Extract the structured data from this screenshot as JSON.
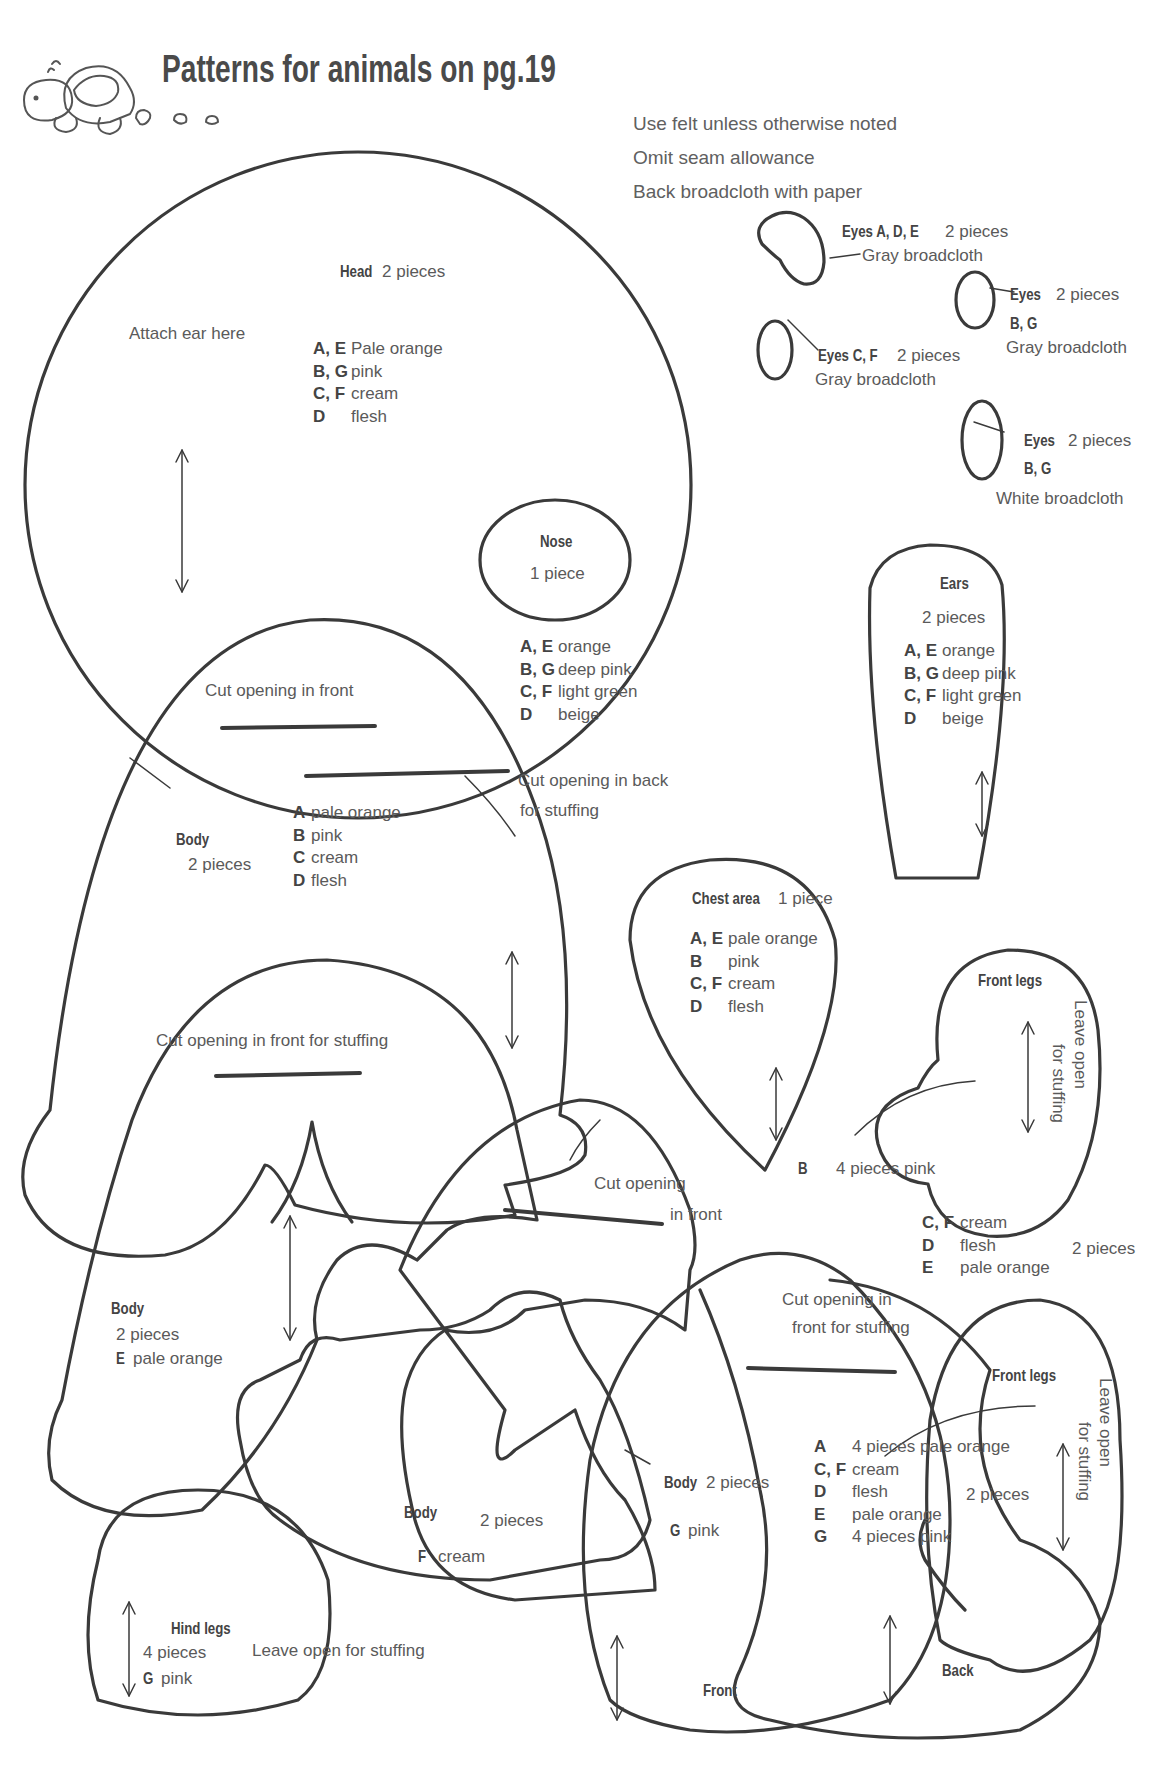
{
  "header": {
    "title": "Patterns for animals on pg.19",
    "icon": "turtle-icon"
  },
  "notes": [
    "Use felt unless otherwise noted",
    "Omit seam allowance",
    "Back broadcloth with paper"
  ],
  "eyes": {
    "ade": {
      "label": "Eyes A, D, E",
      "count": "2 pieces",
      "material": "Gray broadcloth"
    },
    "bg_gray": {
      "label": "Eyes",
      "count": "2 pieces",
      "variants": "B, G",
      "material": "Gray broadcloth"
    },
    "cf": {
      "label": "Eyes C, F",
      "count": "2 pieces",
      "material": "Gray broadcloth"
    },
    "bg_white": {
      "label": "Eyes",
      "count": "2 pieces",
      "variants": "B, G",
      "material": "White broadcloth"
    }
  },
  "head": {
    "label": "Head",
    "count": "2 pieces",
    "attach_note": "Attach ear here",
    "colors": [
      {
        "key": "A, E",
        "value": "Pale orange"
      },
      {
        "key": "B, G",
        "value": "pink"
      },
      {
        "key": "C, F",
        "value": "cream"
      },
      {
        "key": "D",
        "value": "flesh"
      }
    ]
  },
  "nose": {
    "label": "Nose",
    "count": "1 piece",
    "colors": [
      {
        "key": "A, E",
        "value": "orange"
      },
      {
        "key": "B, G",
        "value": "deep pink"
      },
      {
        "key": "C, F",
        "value": "light green"
      },
      {
        "key": "D",
        "value": "beige"
      }
    ]
  },
  "ears": {
    "label": "Ears",
    "count": "2 pieces",
    "colors": [
      {
        "key": "A, E",
        "value": "orange"
      },
      {
        "key": "B, G",
        "value": "deep pink"
      },
      {
        "key": "C, F",
        "value": "light green"
      },
      {
        "key": "D",
        "value": "beige"
      }
    ]
  },
  "body_abcd": {
    "label": "Body",
    "count": "2 pieces",
    "cut_front": "Cut opening in front",
    "cut_back_1": "Cut opening in back",
    "cut_back_2": "for stuffing",
    "colors": [
      {
        "key": "A",
        "value": "pale orange"
      },
      {
        "key": "B",
        "value": "pink"
      },
      {
        "key": "C",
        "value": "cream"
      },
      {
        "key": "D",
        "value": "flesh"
      }
    ]
  },
  "chest": {
    "label": "Chest area",
    "count": "1 piece",
    "colors": [
      {
        "key": "A, E",
        "value": "pale orange"
      },
      {
        "key": "B",
        "value": "pink"
      },
      {
        "key": "C, F",
        "value": "cream"
      },
      {
        "key": "D",
        "value": "flesh"
      }
    ]
  },
  "front_legs_1": {
    "label": "Front legs",
    "leave_open_1": "Leave open",
    "leave_open_2": "for stuffing",
    "b_key": "B",
    "b_text": "4 pieces pink",
    "colors": [
      {
        "key": "C, F",
        "value": "cream"
      },
      {
        "key": "D",
        "value": "flesh"
      },
      {
        "key": "E",
        "value": "pale orange"
      }
    ],
    "bracket_count": "2 pieces"
  },
  "body_e": {
    "label": "Body",
    "count": "2 pieces",
    "key": "E",
    "color": "pale orange",
    "cut_note": "Cut opening in front for stuffing"
  },
  "cut_front_center": {
    "line1": "Cut opening",
    "line2": "in front"
  },
  "body_f": {
    "label": "Body",
    "count": "2 pieces",
    "key": "F",
    "color": "cream"
  },
  "body_g": {
    "label": "Body",
    "count": "2 pieces",
    "key": "G",
    "color": "pink",
    "cut_note_1": "Cut opening in",
    "cut_note_2": "front for stuffing",
    "front_label": "Front",
    "back_label": "Back"
  },
  "front_legs_2": {
    "label": "Front legs",
    "leave_open_1": "Leave open",
    "leave_open_2": "for stuffing",
    "colors": [
      {
        "key": "A",
        "value": "4 pieces pale orange"
      },
      {
        "key": "C, F",
        "value": "cream"
      },
      {
        "key": "D",
        "value": "flesh"
      },
      {
        "key": "E",
        "value": "pale orange"
      },
      {
        "key": "G",
        "value": "4 pieces pink"
      }
    ],
    "bracket_count": "2 pieces"
  },
  "hind_legs": {
    "label": "Hind legs",
    "count": "4 pieces",
    "key": "G",
    "color": "pink",
    "leave_open": "Leave open for stuffing"
  },
  "colors": {
    "line": "#3a3a3a",
    "text": "#5a5a5a",
    "paper": "#ffffff"
  }
}
